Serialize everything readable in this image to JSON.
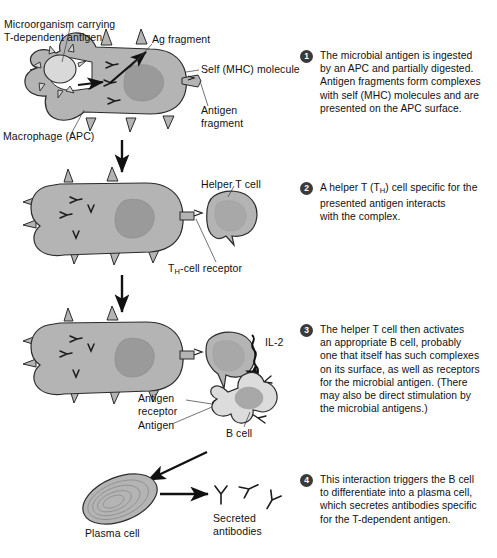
{
  "figure": {
    "colors": {
      "cytoplasm": "#b4b4b4",
      "nucleus": "#9a9a9a",
      "bcell_cytoplasm": "#dcdcdc",
      "bcell_nucleus": "#a8a8a8",
      "microbe": "#d3d3d3",
      "outline": "#2b2b2b",
      "step_badge": "#3a3a3a",
      "text": "#111111"
    }
  },
  "labels": {
    "microorganism": "Microorganism carrying\nT-dependent antigen",
    "ag_fragment": "Ag fragment",
    "self_mhc": "Self (MHC) molecule",
    "antigen_fragment": "Antigen\nfragment",
    "macrophage": "Macrophage (APC)",
    "helper_t_cell": "Helper T cell",
    "th_receptor_pre": "T",
    "th_receptor_sub": "H",
    "th_receptor_post": "-cell receptor",
    "il2": "IL-2",
    "antigen_receptor": "Antigen\nreceptor",
    "antigen": "Antigen",
    "b_cell": "B cell",
    "plasma_cell": "Plasma cell",
    "secreted_antibodies": "Secreted\nantibodies"
  },
  "steps": [
    {
      "number": "1",
      "text": "The microbial antigen is ingested\nby an APC and partially digested.\nAntigen fragments form complexes\nwith self (MHC) molecules and are\npresented on the APC surface."
    },
    {
      "number": "2",
      "text": "A helper T (TH) cell specific for the\npresented antigen interacts\nwith the complex.",
      "rich": true,
      "line1_a": "A helper T (T",
      "line1_sub": "H",
      "line1_b": ") cell specific for the",
      "line_rest": "presented antigen interacts\nwith the complex."
    },
    {
      "number": "3",
      "text": "The helper T cell then activates\nan appropriate B cell, probably\none that itself has such complexes\non its surface, as well as receptors\nfor the microbial antigen. (There\nmay also be direct stimulation by\nthe microbial antigens.)"
    },
    {
      "number": "4",
      "text": "This interaction triggers the B cell\nto differentiate into a plasma cell,\nwhich secretes antibodies specific\nfor the T-dependent antigen."
    }
  ]
}
